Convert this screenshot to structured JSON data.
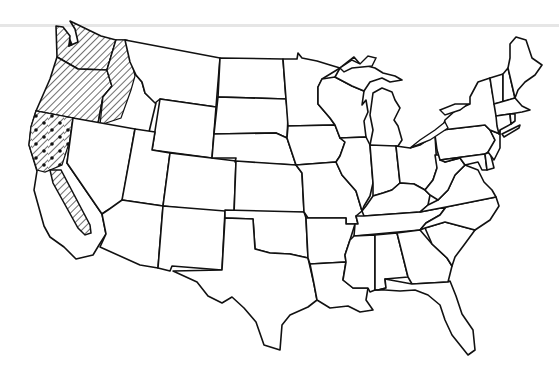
{
  "map": {
    "title": "United States",
    "type": "choropleth-outline",
    "legend": [],
    "patterns": {
      "diagonal_hatch": {
        "color": "#111111",
        "regions": [
          "Washington",
          "Oregon",
          "Idaho (western)",
          "Nevada (western strip)",
          "California (Central Valley)"
        ]
      },
      "dotted_hatch": {
        "color": "#111111",
        "regions": [
          "California (northern)"
        ]
      }
    },
    "states": [
      "WA",
      "OR",
      "CA",
      "ID",
      "NV",
      "MT",
      "WY",
      "UT",
      "AZ",
      "CO",
      "NM",
      "ND",
      "SD",
      "NE",
      "KS",
      "OK",
      "TX",
      "MN",
      "IA",
      "MO",
      "AR",
      "LA",
      "WI",
      "IL",
      "MI",
      "IN",
      "OH",
      "KY",
      "TN",
      "MS",
      "AL",
      "GA",
      "FL",
      "SC",
      "NC",
      "VA",
      "WV",
      "PA",
      "NY",
      "MD",
      "DE",
      "NJ",
      "CT",
      "RI",
      "MA",
      "VT",
      "NH",
      "ME"
    ],
    "colors": {
      "outline": "#111111",
      "background": "#ffffff",
      "top_rule": "#e6e6e6"
    }
  }
}
